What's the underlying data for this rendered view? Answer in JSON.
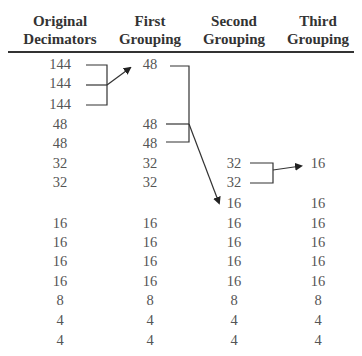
{
  "headers": [
    {
      "line1": "Original",
      "line2": "Decimators"
    },
    {
      "line1": "First",
      "line2": "Grouping"
    },
    {
      "line1": "Second",
      "line2": "Grouping"
    },
    {
      "line1": "Third",
      "line2": "Grouping"
    }
  ],
  "columns": {
    "original": [
      "144",
      "144",
      "144",
      "48",
      "48",
      "32",
      "32",
      "",
      "16",
      "16",
      "16",
      "16",
      "8",
      "4",
      "4"
    ],
    "first": [
      "48",
      "",
      "",
      "48",
      "48",
      "32",
      "32",
      "",
      "16",
      "16",
      "16",
      "16",
      "8",
      "4",
      "4"
    ],
    "second": [
      "",
      "",
      "",
      "",
      "",
      "32",
      "32",
      "16",
      "16",
      "16",
      "16",
      "16",
      "8",
      "4",
      "4"
    ],
    "third": [
      "",
      "",
      "",
      "",
      "",
      "16",
      "",
      "16",
      "16",
      "16",
      "16",
      "16",
      "8",
      "4",
      "4"
    ]
  },
  "groupings": [
    {
      "from": "three 144 decimators",
      "to": "one 48 in First Grouping"
    },
    {
      "from": "three 48 decimators",
      "to": "one 16 in Second Grouping"
    },
    {
      "from": "two 32 decimators",
      "to": "one 16 in Third Grouping"
    }
  ]
}
